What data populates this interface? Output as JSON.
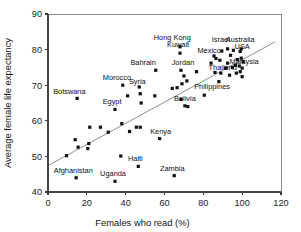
{
  "chart_data": {
    "type": "scatter",
    "title": "",
    "xlabel": "Females who read (%)",
    "ylabel": "Average female life expectancy",
    "xlim": [
      0,
      120
    ],
    "ylim": [
      40,
      90
    ],
    "xticks": [
      0,
      20,
      40,
      60,
      80,
      100,
      120
    ],
    "yticks": [
      40,
      50,
      60,
      70,
      80,
      90
    ],
    "grid": false,
    "legend": false,
    "marker_color": "#111111",
    "trend_line": {
      "visible": true,
      "color": "#707070",
      "x_start": 0,
      "y_start": 47.4,
      "x_end": 117,
      "y_end": 82.2
    },
    "points": [
      {
        "label": "Afghanistan",
        "x": 14.5,
        "y": 44.0
      },
      {
        "label": "Uganda",
        "x": 34.5,
        "y": 43.0
      },
      {
        "label": "Haiti",
        "x": 46.5,
        "y": 47.2
      },
      {
        "label": "Zambia",
        "x": 65.0,
        "y": 44.6
      },
      {
        "label": "Botswana",
        "x": 15.0,
        "y": 66.3
      },
      {
        "label": "Egypt",
        "x": 34.5,
        "y": 63.2
      },
      {
        "label": "Morocco",
        "x": 38.5,
        "y": 70.0
      },
      {
        "label": "Syria",
        "x": 47.0,
        "y": 69.5
      },
      {
        "label": "Kenya",
        "x": 57.5,
        "y": 55.0
      },
      {
        "label": "Bahrain",
        "x": 55.5,
        "y": 74.2
      },
      {
        "label": "Jordan",
        "x": 68.5,
        "y": 74.2
      },
      {
        "label": "Bolivia",
        "x": 70.5,
        "y": 64.2
      },
      {
        "label": "Hong Kong",
        "x": 68.0,
        "y": 80.8
      },
      {
        "label": "Kuwait",
        "x": 68.0,
        "y": 79.0
      },
      {
        "label": "Philippines",
        "x": 80.5,
        "y": 67.2
      },
      {
        "label": "Thailand",
        "x": 89.0,
        "y": 73.4
      },
      {
        "label": "Malaysia",
        "x": 95.0,
        "y": 75.0
      },
      {
        "label": "México",
        "x": 86.5,
        "y": 77.5
      },
      {
        "label": "Israel",
        "x": 92.5,
        "y": 80.2
      },
      {
        "label": "Australia",
        "x": 99.5,
        "y": 80.2
      },
      {
        "label": "USA",
        "x": 99.0,
        "y": 79.5
      },
      {
        "label": "",
        "x": 9.5,
        "y": 50.2
      },
      {
        "label": "",
        "x": 14.0,
        "y": 54.7
      },
      {
        "label": "",
        "x": 15.5,
        "y": 52.6
      },
      {
        "label": "",
        "x": 20.5,
        "y": 52.2
      },
      {
        "label": "",
        "x": 21.0,
        "y": 53.6
      },
      {
        "label": "",
        "x": 21.5,
        "y": 58.2
      },
      {
        "label": "",
        "x": 27.0,
        "y": 58.2
      },
      {
        "label": "",
        "x": 31.0,
        "y": 56.8
      },
      {
        "label": "",
        "x": 37.5,
        "y": 50.1
      },
      {
        "label": "",
        "x": 38.0,
        "y": 59.2
      },
      {
        "label": "",
        "x": 41.0,
        "y": 67.0
      },
      {
        "label": "",
        "x": 42.0,
        "y": 57.0
      },
      {
        "label": "",
        "x": 45.5,
        "y": 58.2
      },
      {
        "label": "",
        "x": 47.5,
        "y": 58.2
      },
      {
        "label": "",
        "x": 47.5,
        "y": 67.6
      },
      {
        "label": "",
        "x": 48.0,
        "y": 65.0
      },
      {
        "label": "",
        "x": 55.0,
        "y": 67.0
      },
      {
        "label": "",
        "x": 64.0,
        "y": 69.1
      },
      {
        "label": "",
        "x": 66.5,
        "y": 69.3
      },
      {
        "label": "",
        "x": 68.5,
        "y": 66.0
      },
      {
        "label": "",
        "x": 69.0,
        "y": 70.4
      },
      {
        "label": "",
        "x": 70.0,
        "y": 72.6
      },
      {
        "label": "",
        "x": 71.5,
        "y": 71.2
      },
      {
        "label": "",
        "x": 72.0,
        "y": 64.0
      },
      {
        "label": "",
        "x": 76.5,
        "y": 73.8
      },
      {
        "label": "",
        "x": 84.0,
        "y": 76.2
      },
      {
        "label": "",
        "x": 85.5,
        "y": 78.2
      },
      {
        "label": "",
        "x": 86.0,
        "y": 73.6
      },
      {
        "label": "",
        "x": 88.0,
        "y": 71.0
      },
      {
        "label": "",
        "x": 88.5,
        "y": 77.0
      },
      {
        "label": "",
        "x": 89.5,
        "y": 79.6
      },
      {
        "label": "",
        "x": 91.5,
        "y": 74.8
      },
      {
        "label": "",
        "x": 92.5,
        "y": 76.2
      },
      {
        "label": "",
        "x": 93.5,
        "y": 72.8
      },
      {
        "label": "",
        "x": 94.0,
        "y": 78.4
      },
      {
        "label": "",
        "x": 95.5,
        "y": 79.8
      },
      {
        "label": "",
        "x": 96.5,
        "y": 75.6
      },
      {
        "label": "",
        "x": 97.0,
        "y": 73.4
      },
      {
        "label": "",
        "x": 97.5,
        "y": 77.2
      },
      {
        "label": "",
        "x": 98.5,
        "y": 75.4
      },
      {
        "label": "",
        "x": 99.0,
        "y": 73.8
      },
      {
        "label": "",
        "x": 99.5,
        "y": 77.6
      },
      {
        "label": "",
        "x": 100.0,
        "y": 74.8
      },
      {
        "label": "",
        "x": 100.0,
        "y": 72.4
      },
      {
        "label": "",
        "x": 100.5,
        "y": 76.6
      }
    ],
    "labels": [
      {
        "text": "Hong Kong",
        "x": 64.0,
        "y": 82.6,
        "anchor": "middle"
      },
      {
        "text": "Kuwait",
        "x": 67.0,
        "y": 80.6,
        "anchor": "middle"
      },
      {
        "text": "Israel",
        "x": 89.0,
        "y": 82.2,
        "anchor": "middle"
      },
      {
        "text": "Australia",
        "x": 99.0,
        "y": 82.2,
        "anchor": "middle"
      },
      {
        "text": "USA",
        "x": 100.0,
        "y": 80.3,
        "anchor": "middle"
      },
      {
        "text": "México",
        "x": 83.0,
        "y": 79.0,
        "anchor": "middle"
      },
      {
        "text": "Bahrain",
        "x": 49.0,
        "y": 75.6,
        "anchor": "middle"
      },
      {
        "text": "Jordan",
        "x": 69.5,
        "y": 75.6,
        "anchor": "middle"
      },
      {
        "text": "Malaysia",
        "x": 101.0,
        "y": 75.9,
        "anchor": "middle"
      },
      {
        "text": "Thailand",
        "x": 90.0,
        "y": 74.2,
        "anchor": "middle"
      },
      {
        "text": "Morocco",
        "x": 35.5,
        "y": 71.6,
        "anchor": "middle"
      },
      {
        "text": "Syria",
        "x": 46.0,
        "y": 70.4,
        "anchor": "middle"
      },
      {
        "text": "Philippines",
        "x": 84.5,
        "y": 69.0,
        "anchor": "middle"
      },
      {
        "text": "Botswana",
        "x": 11.0,
        "y": 67.6,
        "anchor": "middle"
      },
      {
        "text": "Bolivia",
        "x": 70.5,
        "y": 65.6,
        "anchor": "middle"
      },
      {
        "text": "Egypt",
        "x": 33.0,
        "y": 64.8,
        "anchor": "middle"
      },
      {
        "text": "Kenya",
        "x": 58.0,
        "y": 56.4,
        "anchor": "middle"
      },
      {
        "text": "Haiti",
        "x": 45.0,
        "y": 48.6,
        "anchor": "middle"
      },
      {
        "text": "Zambia",
        "x": 64.0,
        "y": 46.0,
        "anchor": "middle"
      },
      {
        "text": "Afghanistan",
        "x": 13.0,
        "y": 45.4,
        "anchor": "middle"
      },
      {
        "text": "Uganda",
        "x": 33.5,
        "y": 44.5,
        "anchor": "middle"
      }
    ]
  }
}
